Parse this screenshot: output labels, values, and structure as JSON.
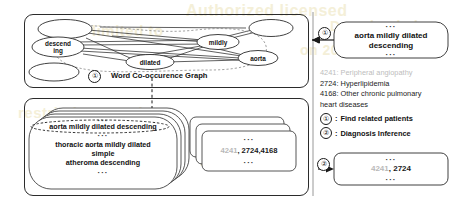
{
  "figure": {
    "watermarks": [
      "Authorized licensed",
      "use limited to",
      "Downloaded",
      "on 2020",
      "restrictions apply",
      "IEEE Xplore",
      "2724"
    ]
  },
  "graph_panel": {
    "caption": "Word Co-occurence  Graph",
    "step_marker": "①",
    "nodes": [
      {
        "id": "n1",
        "label": ""
      },
      {
        "id": "n2",
        "label": "descend\ning"
      },
      {
        "id": "n3",
        "label": ""
      },
      {
        "id": "n4",
        "label": "dilated"
      },
      {
        "id": "n5",
        "label": "mildly"
      },
      {
        "id": "n6",
        "label": "aorta"
      },
      {
        "id": "n7",
        "label": ""
      }
    ]
  },
  "reports_panel": {
    "front_card": {
      "top_dots": "···",
      "highlighted_line": "aorta mildly dilated descending",
      "mid_dots": "···",
      "lines": [
        "thoracic aorta mildly dilated",
        "simple",
        "atheroma descending"
      ],
      "bottom_dots": "···"
    }
  },
  "codes_panel": {
    "top_dots": "···",
    "code_muted": "4241",
    "code_sep": ", ",
    "code_dark": "2724,4168",
    "bottom_dots": "···"
  },
  "query_box": {
    "top_dots": "···",
    "line1": "aorta mildly dilated",
    "line2": "descending",
    "bottom_dots": "···",
    "step_marker": "①"
  },
  "result_box": {
    "top_dots": "···",
    "code_muted": "4241",
    "code_sep": ", ",
    "code_dark": "2724",
    "bottom_dots": "···",
    "step_marker": "②"
  },
  "diagnosis_list": {
    "items": [
      {
        "code": "4241:",
        "name": "Peripheral angiopathy",
        "muted": true,
        "text": "4241: Peripheral angiopathy"
      },
      {
        "code": "2724:",
        "name": "Hyperlipidemia",
        "muted": false,
        "text": "2724: Hyperlipidemia"
      },
      {
        "code": "4168:",
        "name": "Other chronic pulmonary",
        "muted": false,
        "text": "4168: Other chronic pulmonary"
      },
      {
        "code": "",
        "name": "heart diseases",
        "muted": false,
        "text": "heart diseases"
      }
    ]
  },
  "legend": {
    "items": [
      {
        "marker": "①",
        "sep": ":",
        "label": "Find related patients"
      },
      {
        "marker": "②",
        "sep": ":",
        "label": "Diagnosis Inference"
      }
    ]
  },
  "colors": {
    "stroke": "#2b2b2b",
    "muted_text": "#bdbdbd",
    "text": "#111111",
    "watermark": "#f4efd8"
  }
}
